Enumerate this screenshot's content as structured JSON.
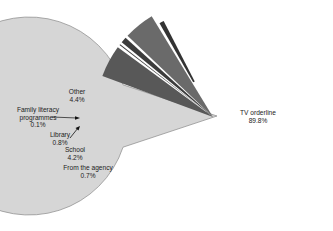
{
  "chart_data": {
    "type": "pie",
    "title": "",
    "exploded": true,
    "categories": [
      "TV orderline",
      "Other",
      "Family literacy programmes",
      "Library",
      "School",
      "From the agency"
    ],
    "values": [
      89.8,
      4.4,
      0.1,
      0.8,
      4.2,
      0.7
    ],
    "unit": "%",
    "colors": [
      "#d6d6d6",
      "#585858",
      "#3a3a3a",
      "#3c3c3c",
      "#6a6a6a",
      "#333333"
    ],
    "labels": [
      {
        "name": "TV orderline",
        "value": "89.8%"
      },
      {
        "name": "Other",
        "value": "4.4%"
      },
      {
        "name": "Family literacy programmes",
        "lines": [
          "Family literacy",
          "programmes"
        ],
        "value": "0.1%"
      },
      {
        "name": "Library",
        "value": "0.8%"
      },
      {
        "name": "School",
        "value": "4.2%"
      },
      {
        "name": "From the agency",
        "value": "0.7%"
      }
    ],
    "legend": "none"
  }
}
